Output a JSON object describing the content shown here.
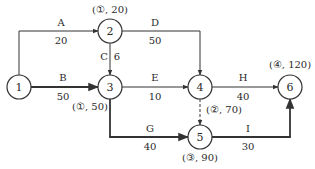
{
  "diagram": {
    "type": "activity-on-arrow network",
    "nodes": [
      {
        "id": "1",
        "label": "1",
        "x": 19,
        "y": 87
      },
      {
        "id": "2",
        "label": "2",
        "x": 110,
        "y": 31
      },
      {
        "id": "3",
        "label": "3",
        "x": 110,
        "y": 87
      },
      {
        "id": "4",
        "label": "4",
        "x": 200,
        "y": 87
      },
      {
        "id": "5",
        "label": "5",
        "x": 200,
        "y": 137
      },
      {
        "id": "6",
        "label": "6",
        "x": 290,
        "y": 87
      }
    ],
    "node_annotations": [
      {
        "node": "2",
        "text": "(①, 20)"
      },
      {
        "node": "3",
        "text": "(①, 50)"
      },
      {
        "node": "4",
        "text": "(②, 70)"
      },
      {
        "node": "5",
        "text": "(③, 90)"
      },
      {
        "node": "6",
        "text": "(④, 120)"
      }
    ],
    "activities": [
      {
        "name": "A",
        "from": "1",
        "to": "2",
        "duration": "20"
      },
      {
        "name": "B",
        "from": "1",
        "to": "3",
        "duration": "50"
      },
      {
        "name": "C",
        "from": "2",
        "to": "3",
        "duration": "6"
      },
      {
        "name": "D",
        "from": "2",
        "to": "4",
        "duration": "50"
      },
      {
        "name": "E",
        "from": "3",
        "to": "4",
        "duration": "10"
      },
      {
        "name": "G",
        "from": "3",
        "to": "5",
        "duration": "40"
      },
      {
        "name": "H",
        "from": "4",
        "to": "6",
        "duration": "40"
      },
      {
        "name": "I",
        "from": "5",
        "to": "6",
        "duration": "30"
      },
      {
        "name": "",
        "from": "4",
        "to": "5",
        "duration": "",
        "dummy": true
      }
    ],
    "colors": {
      "line": "#333333",
      "text": "#2a2a2a",
      "background": "#ffffff"
    }
  }
}
